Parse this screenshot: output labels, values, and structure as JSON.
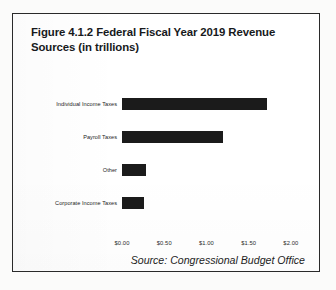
{
  "figure": {
    "title": "Figure 4.1.2 Federal Fiscal Year 2019 Revenue Sources (in trillions)",
    "source_note": "Source: Congressional Budget Office"
  },
  "chart_data": {
    "type": "bar",
    "orientation": "horizontal",
    "title": "Figure 4.1.2 Federal Fiscal Year 2019 Revenue Sources (in trillions)",
    "xlabel": "",
    "ylabel": "",
    "categories": [
      "Individual Income Taxes",
      "Payroll Taxes",
      "Other",
      "Corporate Income Taxes"
    ],
    "values": [
      1.72,
      1.2,
      0.29,
      0.26
    ],
    "value_prefix": "$",
    "xlim": [
      0,
      2.25
    ],
    "xticks": [
      0,
      0.5,
      1.0,
      1.5,
      2.0
    ],
    "xtick_labels": [
      "$0.00",
      "$0.50",
      "$1.00",
      "$1.50",
      "$2.00"
    ],
    "grid": false,
    "legend": "none",
    "bar_color": "#1b1b1b",
    "series": [
      {
        "name": "FY2019 Revenue (trillions)",
        "values": [
          1.72,
          1.2,
          0.29,
          0.26
        ]
      }
    ]
  }
}
